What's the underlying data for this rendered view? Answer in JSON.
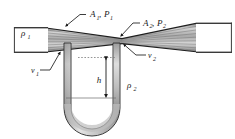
{
  "figure": {
    "background_color": "#ffffff",
    "line_color": "#1a1a1a",
    "fluid_fill_color": "#b9b9b9",
    "manometer_fluid_color": "#c9c9c9",
    "tube_wall_color": "#8a8a8a"
  },
  "labels": {
    "density_inlet": "ρ",
    "density_inlet_sub": "1",
    "density_manometer": "ρ",
    "density_manometer_sub": "2",
    "area_inlet": "A",
    "area_inlet_sub": "1",
    "pressure_inlet": "P",
    "pressure_inlet_sub": "1",
    "area_throat": "A",
    "area_throat_sub": "2",
    "pressure_throat": "P",
    "pressure_throat_sub": "2",
    "velocity_inlet": "v",
    "velocity_inlet_sub": "1",
    "velocity_throat": "v",
    "velocity_throat_sub": "2",
    "height_difference": "h",
    "comma": ","
  },
  "annotations": {
    "inlet_group": "A₁, P₁",
    "throat_group": "A₂, P₂",
    "manometer_height": "h",
    "inlet_density": "ρ₁",
    "manometer_density": "ρ₂",
    "inlet_velocity": "v₁",
    "throat_velocity": "v₂"
  },
  "geometry": {
    "inlet_pipe_top": 28,
    "inlet_pipe_bottom": 52,
    "throat_x": 122,
    "throat_top": 38,
    "throat_bottom": 44,
    "outlet_pipe_top": 24,
    "outlet_pipe_bottom": 52,
    "manometer_left_x": 68,
    "manometer_right_x": 125,
    "manometer_bottom_y": 128,
    "fluid_level_left_y": 57,
    "fluid_level_right_y": 98,
    "streamline_count": 7
  }
}
